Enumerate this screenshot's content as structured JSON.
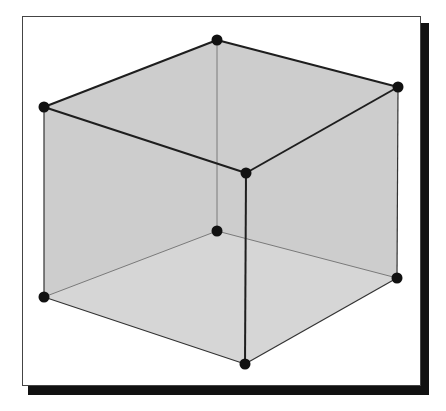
{
  "diagram": {
    "type": "wireframe-cube",
    "colors": {
      "face_fill": "#c8c8c8",
      "bottom_fill": "#d6d6d6",
      "edge_front": "#222222",
      "edge_hidden": "#777777",
      "vertex": "#111111",
      "frame_border": "#444444",
      "frame_shadow": "#111111"
    },
    "vertices": {
      "back_top": [
        217,
        40
      ],
      "left_top": [
        44,
        107
      ],
      "right_top": [
        398,
        87
      ],
      "front_top": [
        246,
        173
      ],
      "back_bottom": [
        217,
        231
      ],
      "left_bottom": [
        44,
        297
      ],
      "right_bottom": [
        397,
        278
      ],
      "front_bottom": [
        245,
        364
      ]
    },
    "vertex_radius": 5.5
  }
}
